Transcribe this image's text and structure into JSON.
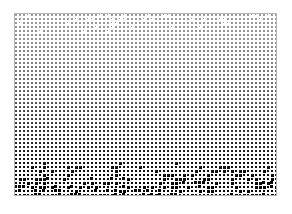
{
  "page": {
    "width": 292,
    "height": 214,
    "background_color": "#ffffff"
  },
  "pattern": {
    "name": "halftone-gradient-grid",
    "x": 14,
    "y": 13,
    "width": 263,
    "height": 183,
    "cell_period_x": 4,
    "cell_period_y": 4,
    "mark_color": "#000000",
    "background_color": "#ffffff",
    "gradient_direction": "top-to-bottom",
    "gradient_min_density": 0.1,
    "gradient_max_density": 0.82,
    "border_color": "#b4b4b4"
  },
  "chart_data": {
    "type": "heatmap",
    "title": "",
    "xlabel": "",
    "ylabel": "",
    "grid": true,
    "legend": "none",
    "xlim": [
      0,
      263
    ],
    "ylim": [
      0,
      183
    ],
    "rows": 46,
    "cols": 66,
    "value_label": "ink density",
    "value_range": [
      0.1,
      0.82
    ],
    "row_density": [
      0.1,
      0.11,
      0.12,
      0.13,
      0.14,
      0.15,
      0.16,
      0.17,
      0.19,
      0.2,
      0.21,
      0.23,
      0.24,
      0.26,
      0.27,
      0.29,
      0.31,
      0.32,
      0.34,
      0.36,
      0.38,
      0.4,
      0.42,
      0.44,
      0.46,
      0.48,
      0.5,
      0.52,
      0.54,
      0.56,
      0.58,
      0.6,
      0.62,
      0.64,
      0.66,
      0.68,
      0.7,
      0.71,
      0.73,
      0.74,
      0.76,
      0.77,
      0.78,
      0.8,
      0.81,
      0.82
    ]
  }
}
